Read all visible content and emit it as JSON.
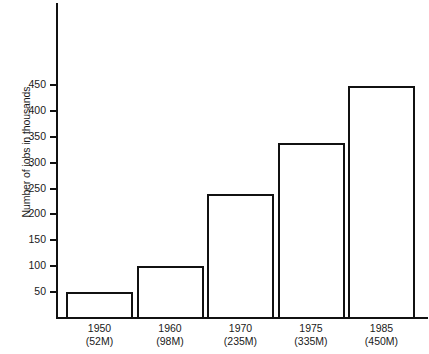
{
  "chart_data": {
    "type": "bar",
    "title": "",
    "xlabel": "",
    "ylabel": "Number of jobs in thousands",
    "categories": [
      "1950",
      "1960",
      "1970",
      "1975",
      "1985"
    ],
    "category_sublabels": [
      "(52M)",
      "(98M)",
      "(235M)",
      "(335M)",
      "(450M)"
    ],
    "values": [
      50,
      100,
      240,
      337,
      447
    ],
    "ylim": [
      0,
      470
    ],
    "yticks": [
      50,
      100,
      150,
      200,
      250,
      300,
      350,
      400,
      450
    ],
    "ytick_labels": [
      "50",
      "100",
      "150",
      "200",
      "250",
      "300",
      "350",
      "400",
      "450"
    ],
    "grid": false,
    "legend": "none",
    "bar_style": "outlined",
    "bar_fill": "#ffffff",
    "bar_stroke": "#111111",
    "axis_color": "#111111",
    "background": "#ffffff"
  }
}
